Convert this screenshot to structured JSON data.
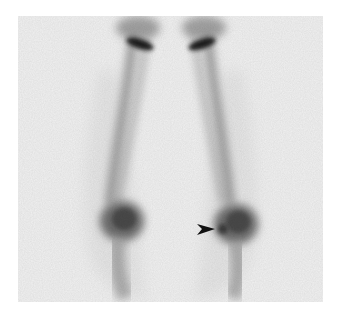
{
  "image": {
    "description": "Anterior bone scintigraphy of both lower extremities (femora and tibiae) with arrowhead marking focal uptake at the right knee region",
    "background_color": "#f1f1f1",
    "uptake_color": "#2a2a2a",
    "arrow": {
      "label": "arrowhead",
      "direction": "right",
      "color": "#111111"
    }
  }
}
